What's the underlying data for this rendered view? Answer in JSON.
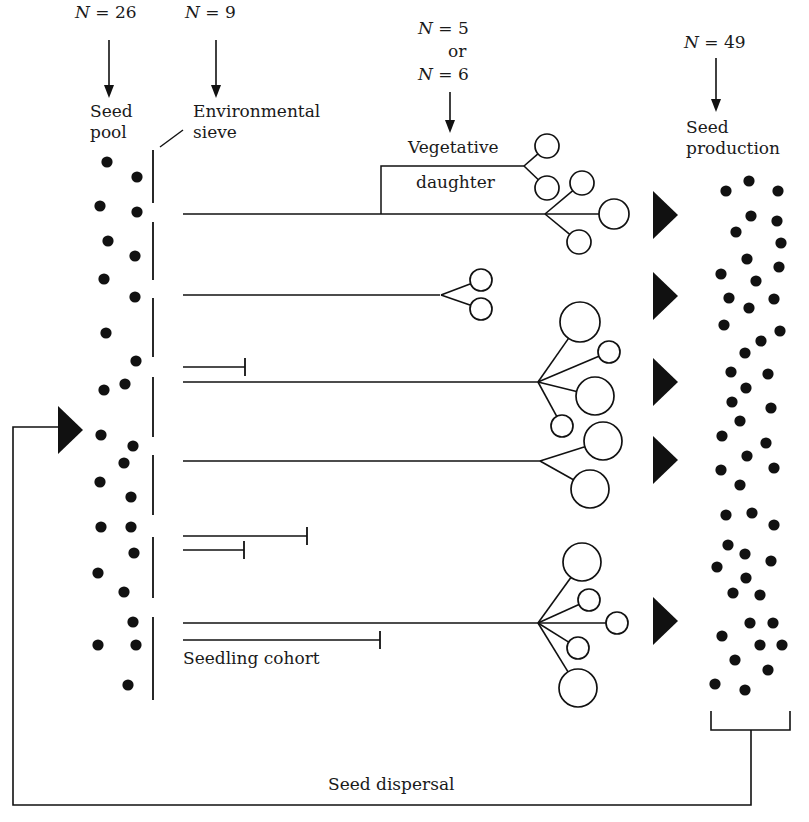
{
  "diagram": {
    "colors": {
      "ink": "#111111",
      "paper": "#ffffff"
    },
    "headers": [
      {
        "id": "seed-pool-count",
        "n_var": "N",
        "eq": " = 26",
        "x": 75,
        "y": 2
      },
      {
        "id": "sieve-count",
        "n_var": "N",
        "eq": " = 9",
        "x": 185,
        "y": 2
      },
      {
        "id": "vegetative-count",
        "n_var": "N",
        "eq": " = 5",
        "x": 418,
        "y": 18
      },
      {
        "id": "vegetative-count-alt",
        "n_var": "N",
        "eq": " = 6",
        "x": 418,
        "y": 64
      },
      {
        "id": "seed-production-count",
        "n_var": "N",
        "eq": " = 49",
        "x": 684,
        "y": 32
      }
    ],
    "or_label": {
      "text": "or",
      "x": 448,
      "y": 41
    },
    "labels": {
      "seed_pool": {
        "line1": "Seed",
        "line2": "pool",
        "x": 90,
        "y": 101
      },
      "environmental_sieve": {
        "line1": "Environmental",
        "line2": "sieve",
        "x": 193,
        "y": 101
      },
      "vegetative_daughter": {
        "line1": "Vegetative",
        "line2": "daughter",
        "x": 408,
        "y": 137,
        "line2_x": 416,
        "line2_y": 172
      },
      "seed_production": {
        "line1": "Seed",
        "line2": "production",
        "x": 686,
        "y": 117
      },
      "seedling_cohort": {
        "text": "Seedling cohort",
        "x": 183,
        "y": 648
      },
      "seed_dispersal": {
        "text": "Seed dispersal",
        "x": 328,
        "y": 774
      }
    },
    "arrows_down": [
      {
        "x": 109,
        "y1": 40,
        "y2": 98
      },
      {
        "x": 216,
        "y1": 40,
        "y2": 98
      },
      {
        "x": 450,
        "y1": 92,
        "y2": 133
      },
      {
        "x": 716,
        "y1": 58,
        "y2": 112
      }
    ],
    "seed_pool_dots": [
      [
        107,
        162
      ],
      [
        137,
        177
      ],
      [
        100,
        206
      ],
      [
        137,
        212
      ],
      [
        108,
        241
      ],
      [
        135,
        256
      ],
      [
        104,
        279
      ],
      [
        135,
        297
      ],
      [
        106,
        333
      ],
      [
        136,
        361
      ],
      [
        104,
        390
      ],
      [
        125,
        384
      ],
      [
        101,
        435
      ],
      [
        133,
        446
      ],
      [
        124,
        463
      ],
      [
        100,
        482
      ],
      [
        131,
        497
      ],
      [
        101,
        527
      ],
      [
        131,
        527
      ],
      [
        134,
        553
      ],
      [
        98,
        573
      ],
      [
        124,
        592
      ],
      [
        133,
        622
      ],
      [
        98,
        645
      ],
      [
        136,
        645
      ],
      [
        128,
        685
      ]
    ],
    "sieve_segments": [
      [
        150,
        203
      ],
      [
        222,
        280
      ],
      [
        298,
        357
      ],
      [
        377,
        437
      ],
      [
        455,
        515
      ],
      [
        537,
        598
      ],
      [
        617,
        700
      ]
    ],
    "sieve_x": 153,
    "sieve_pointer": {
      "x1": 160,
      "y1": 147,
      "x2": 183,
      "y2": 130
    },
    "seedling_lines": [
      {
        "id": "plant-1",
        "x1": 183,
        "y": 214,
        "x2": 545,
        "ends": "branch"
      },
      {
        "id": "plant-2",
        "x1": 183,
        "y": 295,
        "x2": 440,
        "ends": "branch"
      },
      {
        "id": "dead-1",
        "x1": 183,
        "y": 367,
        "x2": 245,
        "ends": "bar"
      },
      {
        "id": "plant-3",
        "x1": 183,
        "y": 382,
        "x2": 538,
        "ends": "branch"
      },
      {
        "id": "plant-4",
        "x1": 183,
        "y": 461,
        "x2": 540,
        "ends": "branch"
      },
      {
        "id": "dead-2",
        "x1": 183,
        "y": 536,
        "x2": 307,
        "ends": "bar"
      },
      {
        "id": "dead-3",
        "x1": 183,
        "y": 550,
        "x2": 244,
        "ends": "bar"
      },
      {
        "id": "plant-5",
        "x1": 183,
        "y": 623,
        "x2": 538,
        "ends": "branch"
      },
      {
        "id": "dead-4",
        "x1": 183,
        "y": 640,
        "x2": 380,
        "ends": "bar"
      }
    ],
    "vegetative_connector": {
      "x": 381,
      "y_top": 166,
      "y_bottom": 214,
      "x_right": 524
    },
    "branches": [
      {
        "origin": [
          524,
          166
        ],
        "flowers": [
          [
            547,
            146,
            12
          ],
          [
            547,
            188,
            12
          ]
        ]
      },
      {
        "origin": [
          545,
          214
        ],
        "flowers": [
          [
            582,
            183,
            12
          ],
          [
            614,
            214,
            15
          ],
          [
            579,
            242,
            12
          ]
        ]
      },
      {
        "origin": [
          441,
          295
        ],
        "flowers": [
          [
            481,
            280,
            11
          ],
          [
            481,
            309,
            11
          ]
        ]
      },
      {
        "origin": [
          538,
          382
        ],
        "flowers": [
          [
            580,
            322,
            20
          ],
          [
            609,
            352,
            11
          ],
          [
            595,
            396,
            19
          ],
          [
            562,
            426,
            11
          ]
        ]
      },
      {
        "origin": [
          540,
          461
        ],
        "flowers": [
          [
            603,
            441,
            19
          ],
          [
            590,
            489,
            19
          ]
        ]
      },
      {
        "origin": [
          538,
          623
        ],
        "flowers": [
          [
            582,
            562,
            19
          ],
          [
            589,
            600,
            11
          ],
          [
            617,
            623,
            11
          ],
          [
            578,
            648,
            11
          ],
          [
            578,
            688,
            19
          ]
        ]
      }
    ],
    "triangles": [
      {
        "x": 653,
        "y": 215,
        "w": 25,
        "h": 48
      },
      {
        "x": 653,
        "y": 296,
        "w": 25,
        "h": 48
      },
      {
        "x": 653,
        "y": 382,
        "w": 25,
        "h": 48
      },
      {
        "x": 653,
        "y": 460,
        "w": 25,
        "h": 48
      },
      {
        "x": 653,
        "y": 621,
        "w": 25,
        "h": 48
      },
      {
        "x": 58,
        "y": 430,
        "w": 25,
        "h": 48
      }
    ],
    "seed_production_dots": [
      [
        726,
        191
      ],
      [
        749,
        181
      ],
      [
        778,
        191
      ],
      [
        751,
        216
      ],
      [
        777,
        221
      ],
      [
        736,
        232
      ],
      [
        781,
        243
      ],
      [
        747,
        259
      ],
      [
        779,
        267
      ],
      [
        721,
        274
      ],
      [
        756,
        281
      ],
      [
        729,
        298
      ],
      [
        774,
        299
      ],
      [
        749,
        308
      ],
      [
        724,
        325
      ],
      [
        780,
        331
      ],
      [
        761,
        341
      ],
      [
        745,
        353
      ],
      [
        731,
        372
      ],
      [
        768,
        374
      ],
      [
        746,
        388
      ],
      [
        732,
        402
      ],
      [
        771,
        408
      ],
      [
        740,
        421
      ],
      [
        722,
        436
      ],
      [
        766,
        443
      ],
      [
        747,
        456
      ],
      [
        774,
        468
      ],
      [
        721,
        470
      ],
      [
        740,
        485
      ],
      [
        726,
        515
      ],
      [
        752,
        513
      ],
      [
        774,
        525
      ],
      [
        728,
        545
      ],
      [
        745,
        554
      ],
      [
        771,
        561
      ],
      [
        717,
        567
      ],
      [
        746,
        578
      ],
      [
        733,
        593
      ],
      [
        760,
        595
      ],
      [
        773,
        623
      ],
      [
        750,
        623
      ],
      [
        722,
        636
      ],
      [
        760,
        645
      ],
      [
        735,
        660
      ],
      [
        768,
        670
      ],
      [
        715,
        684
      ],
      [
        745,
        690
      ],
      [
        782,
        645
      ]
    ],
    "production_bracket": {
      "x1": 711,
      "x2": 790,
      "y_top": 711,
      "y_bottom": 730,
      "stem_x": 751
    },
    "feedback_loop": {
      "right_x": 751,
      "bottom_y": 805,
      "left_x": 13,
      "top_y": 427,
      "end_x": 58
    }
  }
}
